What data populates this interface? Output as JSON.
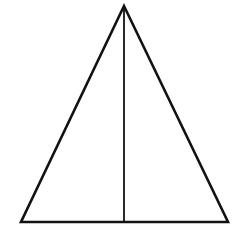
{
  "figure": {
    "name": "isosceles-triangle-with-median",
    "background_color": "#ffffff",
    "canvas": {
      "width": 246,
      "height": 238
    },
    "stroke_color": "#121212",
    "stroke_width_outline": 2.6,
    "stroke_width_median": 1.8,
    "fill_color": "none",
    "vertices": {
      "apex": {
        "label": "apex",
        "x": 124,
        "y": 6
      },
      "bottom_left": {
        "label": "bottom-left",
        "x": 21,
        "y": 222
      },
      "bottom_right": {
        "label": "bottom-right",
        "x": 228,
        "y": 222
      }
    },
    "median": {
      "label": "vertical-median",
      "from": {
        "x": 124,
        "y": 6
      },
      "to": {
        "x": 124,
        "y": 222
      }
    },
    "outline_path": "M 124 6 L 228 222 L 21 222 Z",
    "median_path": "M 124 6 L 124 222"
  },
  "chart_data": {
    "type": "scatter",
    "title": "",
    "xlabel": "",
    "ylabel": "",
    "grid": false,
    "legend": "none",
    "xlim": [
      0,
      246
    ],
    "ylim": [
      0,
      238
    ],
    "shapes": [
      {
        "kind": "polygon",
        "name": "triangle-outline",
        "points": [
          [
            124,
            6
          ],
          [
            228,
            222
          ],
          [
            21,
            222
          ]
        ],
        "closed": true,
        "stroke": "#121212",
        "stroke_width": 2.6,
        "fill": "none"
      },
      {
        "kind": "line",
        "name": "vertical-median",
        "points": [
          [
            124,
            6
          ],
          [
            124,
            222
          ]
        ],
        "closed": false,
        "stroke": "#121212",
        "stroke_width": 1.8,
        "fill": "none"
      }
    ],
    "annotations": []
  }
}
